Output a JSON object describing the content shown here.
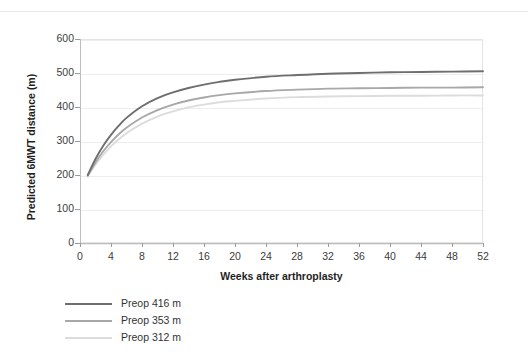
{
  "figure": {
    "background": "#ffffff"
  },
  "chart_data": {
    "type": "line",
    "title": "",
    "xlabel": "Weeks after arthroplasty",
    "ylabel": "Predicted 6MWT distance (m)",
    "xlim": [
      0,
      52
    ],
    "ylim": [
      0,
      600
    ],
    "xticks": [
      0,
      4,
      8,
      12,
      16,
      20,
      24,
      28,
      32,
      36,
      40,
      44,
      48,
      52
    ],
    "yticks": [
      0,
      100,
      200,
      300,
      400,
      500,
      600
    ],
    "grid": "horizontal",
    "legend_position": "below-left",
    "x": [
      1,
      2,
      3,
      4,
      5,
      6,
      8,
      10,
      12,
      14,
      16,
      18,
      20,
      24,
      28,
      32,
      36,
      40,
      44,
      48,
      52
    ],
    "series": [
      {
        "name": "Preop 416 m",
        "color": "#6e6e6e",
        "values": [
          200,
          247,
          286,
          318,
          345,
          368,
          402,
          426,
          443,
          456,
          466,
          474,
          480,
          489,
          494,
          498,
          500,
          502,
          503,
          504,
          505
        ]
      },
      {
        "name": "Preop 353 m",
        "color": "#a8a8a8",
        "values": [
          198,
          237,
          270,
          297,
          320,
          339,
          369,
          391,
          407,
          419,
          428,
          435,
          440,
          447,
          451,
          454,
          455,
          456,
          457,
          457,
          458
        ]
      },
      {
        "name": "Preop 312 m",
        "color": "#dcdcdc",
        "values": [
          196,
          230,
          259,
          284,
          305,
          323,
          351,
          372,
          387,
          399,
          407,
          414,
          418,
          425,
          429,
          431,
          432,
          433,
          433,
          434,
          434
        ]
      }
    ]
  },
  "legend": {
    "entries": [
      {
        "label": "Preop 416 m",
        "color": "#6e6e6e"
      },
      {
        "label": "Preop 353 m",
        "color": "#a8a8a8"
      },
      {
        "label": "Preop 312 m",
        "color": "#dcdcdc"
      }
    ]
  },
  "colors": {
    "gridline": "#ededed",
    "axis": "#bdbdbd",
    "plot_border": "#e4e4e4",
    "text": "#3c3c3c"
  }
}
